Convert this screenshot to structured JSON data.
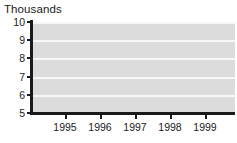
{
  "chart_data": {
    "type": "line",
    "title": "Thousands",
    "xlabel": "",
    "ylabel": "",
    "categories": [
      "1995",
      "1996",
      "1997",
      "1998",
      "1999"
    ],
    "values": [
      7.6,
      9.35,
      8.65,
      8.6,
      6.3
    ],
    "series": [
      {
        "name": "Thousands",
        "values": [
          7.6,
          9.35,
          8.65,
          8.6,
          6.3
        ]
      }
    ],
    "ylim": [
      5,
      10
    ],
    "yticks": [
      "5",
      "6",
      "7",
      "8",
      "9",
      "10"
    ],
    "xticks": [
      "1995",
      "1996",
      "1997",
      "1998",
      "1999"
    ],
    "grid": true,
    "grid_orientation": "horizontal",
    "legend": false,
    "legend_position": "none",
    "marker": "diamond",
    "marker_color": "#1a1a1a",
    "line_color": "#1a1a1a",
    "plot_background": "#dcdcdc",
    "gridline_color": "#f7f7f7",
    "axis_color": "#1a1a1a",
    "page_background": "#ffffff"
  }
}
